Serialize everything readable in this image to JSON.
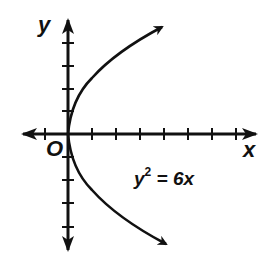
{
  "diagram": {
    "type": "coordinate-plane-parabola",
    "equation": {
      "lhs_var": "y",
      "exponent": "2",
      "rest": " = 6x",
      "full": "y^2 = 6x"
    },
    "axes": {
      "x_label": "x",
      "y_label": "y",
      "origin_label": "O",
      "x_ticks_left_of_origin": 1,
      "x_ticks_right_of_origin": 7,
      "y_ticks_above_origin": 4,
      "y_ticks_below_origin": 4
    },
    "curve": {
      "description": "Parabola opening right, vertex at origin, arrows on both ends",
      "vertex": [
        0,
        0
      ],
      "opens": "right"
    },
    "colors": {
      "stroke": "#111111",
      "background": "#ffffff"
    }
  }
}
